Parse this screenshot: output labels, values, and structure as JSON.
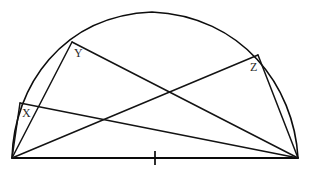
{
  "figure": {
    "kind": "geometry-diagram",
    "width": 312,
    "height": 177,
    "background": "#ffffff",
    "ink_color": "#0d0d0d"
  },
  "labels": {
    "x": "X",
    "y": "Y",
    "z": "Z"
  },
  "points": {
    "A": {
      "name": "left-endpoint",
      "x": 12,
      "y": 158
    },
    "B": {
      "name": "right-endpoint",
      "x": 298,
      "y": 158
    },
    "X": {
      "name": "arc-point-x",
      "x": 20,
      "y": 103
    },
    "Y": {
      "name": "arc-point-y",
      "x": 72,
      "y": 42
    },
    "Z": {
      "name": "arc-point-z",
      "x": 258,
      "y": 55
    },
    "apex": {
      "name": "arc-apex",
      "x": 152,
      "y": 12
    },
    "tick": {
      "name": "baseline-midpoint-tick",
      "x": 155,
      "y": 158
    }
  },
  "label_positions": {
    "x": {
      "x": 22,
      "y": 117
    },
    "y": {
      "x": 74,
      "y": 57
    },
    "z": {
      "x": 250,
      "y": 71
    }
  },
  "paths": {
    "arc": "M 12 158 C 14 86 62 16 152 12 C 242 16 294 86 298 158",
    "baseline": "M 12 158 L 298 158",
    "tick": "M 155 151 L 155 165",
    "chord_A_X": "M 12 158 L 20 103",
    "chord_A_Y": "M 12 158 L 72 42",
    "chord_A_Z": "M 12 158 L 258 55",
    "chord_X_B": "M 20 103 L 298 158",
    "chord_Y_B": "M 72 42 L 298 158",
    "chord_Z_B": "M 258 55 L 298 158"
  },
  "edge_list": [
    {
      "from": "A",
      "to": "X",
      "name": "segment-a-x"
    },
    {
      "from": "A",
      "to": "Y",
      "name": "segment-a-y"
    },
    {
      "from": "A",
      "to": "Z",
      "name": "segment-a-z"
    },
    {
      "from": "X",
      "to": "B",
      "name": "segment-x-b"
    },
    {
      "from": "Y",
      "to": "B",
      "name": "segment-y-b"
    },
    {
      "from": "Z",
      "to": "B",
      "name": "segment-z-b"
    },
    {
      "from": "A",
      "to": "B",
      "name": "segment-baseline"
    }
  ]
}
